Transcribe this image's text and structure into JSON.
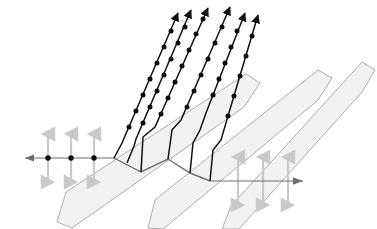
{
  "figure": {
    "type": "optics-ray-diagram",
    "background_color": "#ffffff"
  },
  "colors": {
    "slab_fill": "#f2f2f2",
    "slab_stroke": "#9a9a9a",
    "ray_black": "#111111",
    "ray_gray": "#6e6e6e",
    "polarization_arrow": "#c9c9c9",
    "dot": "#0d0d0d"
  },
  "slabs": {
    "count": 3,
    "angle_deg": 33,
    "thickness_px": 22,
    "label": "transparent slab",
    "items": [
      {
        "name": "slab-1",
        "points": "57,222 66,192 246,74 260,83 244,107 72,228"
      },
      {
        "name": "slab-2",
        "points": "148,228 155,200 318,70 332,78 318,100 163,229"
      },
      {
        "name": "slab-3",
        "points": "222,229 231,206 362,62 375,70 362,92 239,229"
      }
    ]
  },
  "incoming_ray": {
    "name": "incoming-ray",
    "label": "incident ray",
    "path": "M 25,158 L 114,158",
    "arrow_head_at": "25,158",
    "direction": "right",
    "color": "#6e6e6e",
    "dots": [
      {
        "x": 48,
        "y": 158
      },
      {
        "x": 71,
        "y": 158
      },
      {
        "x": 94,
        "y": 158
      }
    ],
    "polarization_arrows": [
      {
        "x": 48,
        "top": 133,
        "bottom": 183
      },
      {
        "x": 71,
        "top": 133,
        "bottom": 183
      },
      {
        "x": 94,
        "top": 133,
        "bottom": 183
      }
    ]
  },
  "outgoing_ray": {
    "name": "outgoing-ray",
    "label": "transmitted ray",
    "path": "M 210,181 L 303,181",
    "arrow_head_at": "303,181",
    "direction": "right",
    "color": "#6e6e6e",
    "polarization_arrows": [
      {
        "x": 238,
        "top": 156,
        "bottom": 206
      },
      {
        "x": 263,
        "top": 156,
        "bottom": 206
      },
      {
        "x": 288,
        "top": 156,
        "bottom": 206
      }
    ]
  },
  "interface_ray": {
    "name": "interface-ray",
    "label": "ray along slab interfaces",
    "path": "M 114,158 L 141,172 L 168,159 L 190,173 L 210,181",
    "color": "#6e6e6e"
  },
  "upward_rays": {
    "name": "upward-rays",
    "label": "reflected / emergent rays",
    "count": 6,
    "arrow_head": true,
    "dot_spacing_px": 17,
    "items": [
      {
        "name": "ray-1",
        "path": "M 114,158 L 122,143 L 178,13",
        "arrow_at": "178,13"
      },
      {
        "name": "ray-2",
        "path": "M 127,163 L 134,146 L 136,139 L 191,10",
        "arrow_at": "191,10"
      },
      {
        "name": "ray-3",
        "path": "M 141,172 L 143,137 L 155,127 L 208,8",
        "arrow_at": "208,8"
      },
      {
        "name": "ray-4",
        "path": "M 168,159 L 172,130 L 181,120 L 230,7",
        "arrow_at": "230,7"
      },
      {
        "name": "ray-5",
        "path": "M 190,173 L 193,143 L 200,130 L 206,113 L 245,13",
        "arrow_at": "245,13"
      },
      {
        "name": "ray-6",
        "path": "M 210,181 L 213,150 L 221,140 L 228,116 L 258,15",
        "arrow_at": "258,15"
      }
    ]
  }
}
